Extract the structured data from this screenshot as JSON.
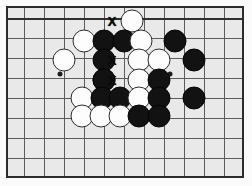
{
  "diagram": {
    "board": {
      "background_color": "#e9e9e9",
      "line_color": "#5b5b5b",
      "border_color": "#2c2c2c",
      "grid_spacing_px": 20,
      "origin_x_px": 18,
      "origin_y_px": 12,
      "columns": 12,
      "rows": 9
    },
    "stone_colors": {
      "black": "#121212",
      "white": "#fdfdfd",
      "white_outline": "#2b2b2b"
    },
    "star_points": [
      {
        "x": 58,
        "y": 72
      },
      {
        "x": 168,
        "y": 72
      }
    ],
    "stones": [
      {
        "color": "white",
        "x": 130,
        "y": 19,
        "label": "white-stone"
      },
      {
        "color": "white",
        "x": 82,
        "y": 39,
        "label": "white-stone"
      },
      {
        "color": "black",
        "x": 102,
        "y": 39,
        "label": "black-stone"
      },
      {
        "color": "black",
        "x": 122,
        "y": 39,
        "label": "black-stone"
      },
      {
        "color": "white",
        "x": 139,
        "y": 39,
        "label": "white-stone"
      },
      {
        "color": "black",
        "x": 173,
        "y": 39,
        "label": "black-stone"
      },
      {
        "color": "white",
        "x": 62,
        "y": 58,
        "label": "white-stone"
      },
      {
        "color": "black",
        "x": 102,
        "y": 58,
        "label": "black-stone"
      },
      {
        "color": "white",
        "x": 137,
        "y": 58,
        "label": "white-stone"
      },
      {
        "color": "white",
        "x": 157,
        "y": 58,
        "label": "white-stone"
      },
      {
        "color": "black",
        "x": 192,
        "y": 58,
        "label": "black-stone"
      },
      {
        "color": "black",
        "x": 102,
        "y": 78,
        "label": "black-stone"
      },
      {
        "color": "black",
        "x": 102,
        "y": 78,
        "label": "black-stone"
      },
      {
        "color": "white",
        "x": 137,
        "y": 78,
        "label": "white-stone"
      },
      {
        "color": "black",
        "x": 157,
        "y": 78,
        "label": "black-stone"
      },
      {
        "color": "white",
        "x": 80,
        "y": 96,
        "label": "white-stone"
      },
      {
        "color": "black",
        "x": 100,
        "y": 96,
        "label": "black-stone"
      },
      {
        "color": "black",
        "x": 118,
        "y": 96,
        "label": "black-stone"
      },
      {
        "color": "white",
        "x": 137,
        "y": 96,
        "label": "white-stone"
      },
      {
        "color": "black",
        "x": 157,
        "y": 96,
        "label": "black-stone"
      },
      {
        "color": "black",
        "x": 192,
        "y": 96,
        "label": "black-stone"
      },
      {
        "color": "white",
        "x": 80,
        "y": 114,
        "label": "white-stone"
      },
      {
        "color": "white",
        "x": 99,
        "y": 114,
        "label": "white-stone"
      },
      {
        "color": "white",
        "x": 118,
        "y": 114,
        "label": "white-stone"
      },
      {
        "color": "black",
        "x": 137,
        "y": 114,
        "label": "black-stone"
      },
      {
        "color": "black",
        "x": 157,
        "y": 114,
        "label": "black-stone"
      }
    ],
    "marks": [
      {
        "symbol": "X",
        "x": 110,
        "y": 19,
        "label": "mark-x-top"
      },
      {
        "symbol": "X",
        "x": 110,
        "y": 58,
        "label": "mark-x-middle"
      },
      {
        "symbol": "X",
        "x": 110,
        "y": 78,
        "label": "mark-x-lower"
      }
    ]
  }
}
